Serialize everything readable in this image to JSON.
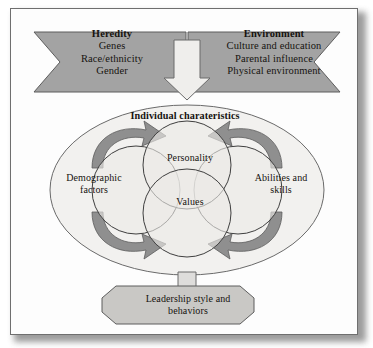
{
  "figure": {
    "type": "influence-flow-diagram",
    "colors": {
      "banner_fill": "#a3a3a3",
      "banner_stroke": "#5d5d5d",
      "oval_fill": "#f2f1ef",
      "circle_fill": "#ebeae7",
      "arrow_fill": "#8f8f8f",
      "outcome_fill": "#c9c8c5",
      "stroke": "#4a4a4a",
      "text": "#16130f",
      "page": "#fdfdfd"
    }
  },
  "inputs": [
    {
      "id": "heredity",
      "title": "Heredity",
      "items": [
        "Genes",
        "Race/ethnicity",
        "Gender"
      ],
      "direction": "left-chevron"
    },
    {
      "id": "environment",
      "title": "Environment",
      "items": [
        "Culture and education",
        "Parental influence",
        "Physical environment"
      ],
      "direction": "right-chevron"
    }
  ],
  "connector": {
    "shape": "hollow-down-arrow",
    "from": "inputs",
    "to": "individual-characteristics"
  },
  "center": {
    "title": "Individual charateristics",
    "circles": [
      {
        "id": "demographic-factors",
        "line1": "Demographic",
        "line2": "factors"
      },
      {
        "id": "personality",
        "line1": "Personality",
        "line2": ""
      },
      {
        "id": "values",
        "line1": "Values",
        "line2": ""
      },
      {
        "id": "abilities-skills",
        "line1": "Abilities and",
        "line2": "skills"
      }
    ],
    "curved_arrows": 4
  },
  "outcome": {
    "shape": "octagon",
    "line1": "Leadership style and",
    "line2": "behaviors"
  }
}
